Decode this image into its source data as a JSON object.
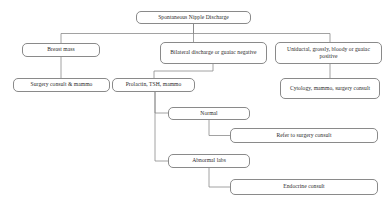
{
  "diagram": {
    "title": "Spontaneous Nipple Discharge",
    "type": "clinical-algorithm-flowchart",
    "orientation": "top-down",
    "nodes": [
      {
        "id": "root",
        "label": "Spontaneous Nipple Discharge",
        "x": 136,
        "y": 11,
        "w": 115,
        "h": 13
      },
      {
        "id": "breast-mass",
        "label": "Breast mass",
        "x": 22,
        "y": 43,
        "w": 78,
        "h": 14
      },
      {
        "id": "bilateral",
        "label": "Bilateral discharge or guaiac negative",
        "x": 160,
        "y": 42,
        "w": 107,
        "h": 22
      },
      {
        "id": "uniductal",
        "label": "Uniductal, grossly, bloody or guaiac positive",
        "x": 275,
        "y": 42,
        "w": 107,
        "h": 22
      },
      {
        "id": "surgery-mammo",
        "label": "Surgery consult & mammo",
        "x": 13,
        "y": 78,
        "w": 97,
        "h": 14
      },
      {
        "id": "prolactin",
        "label": "Prolactin, TSH, mammo",
        "x": 112,
        "y": 78,
        "w": 83,
        "h": 14
      },
      {
        "id": "cytology",
        "label": "Cytology, mammo, surgery consult",
        "x": 280,
        "y": 78,
        "w": 100,
        "h": 21
      },
      {
        "id": "normal",
        "label": "Normal",
        "x": 168,
        "y": 107,
        "w": 82,
        "h": 13
      },
      {
        "id": "refer-surgery",
        "label": "Refer to surgery consult",
        "x": 230,
        "y": 128,
        "w": 148,
        "h": 15
      },
      {
        "id": "abnormal-labs",
        "label": "Abnormal labs",
        "x": 168,
        "y": 154,
        "w": 82,
        "h": 14
      },
      {
        "id": "endocrine",
        "label": "Endocrine consult",
        "x": 230,
        "y": 179,
        "w": 148,
        "h": 16
      }
    ],
    "edges": [
      {
        "from": "root",
        "to": "breast-mass",
        "path": "M193.5,24 L193.5,33.5 L61,33.5 L61,43"
      },
      {
        "from": "root",
        "to": "bilateral",
        "path": "M193.5,24 L193.5,42"
      },
      {
        "from": "root",
        "to": "uniductal",
        "path": "M193.5,24 L193.5,33.5 L330,33.5 L330,42"
      },
      {
        "from": "breast-mass",
        "to": "surgery-mammo",
        "path": "M61,57 L61,78"
      },
      {
        "from": "bilateral",
        "to": "prolactin",
        "path": "M213,64 L213,71 L154,71 L154,78"
      },
      {
        "from": "uniductal",
        "to": "cytology",
        "path": "M330,64 L330,78"
      },
      {
        "from": "prolactin",
        "to": "normal",
        "path": "M155,92 L155,113 L168,113"
      },
      {
        "from": "prolactin",
        "to": "abnormal-labs",
        "path": "M155,92 L155,161 L168,161"
      },
      {
        "from": "normal",
        "to": "refer-surgery",
        "path": "M209,120 L209,135.5 L230,135.5"
      },
      {
        "from": "abnormal-labs",
        "to": "endocrine",
        "path": "M209,168 L209,187 L230,187"
      }
    ],
    "style": {
      "node_border_color": "#8a8a8a",
      "node_fill_color": "#ffffff",
      "edge_color": "#8a8a8a",
      "text_color": "#2b2b2b",
      "background_color": "#ffffff"
    }
  }
}
